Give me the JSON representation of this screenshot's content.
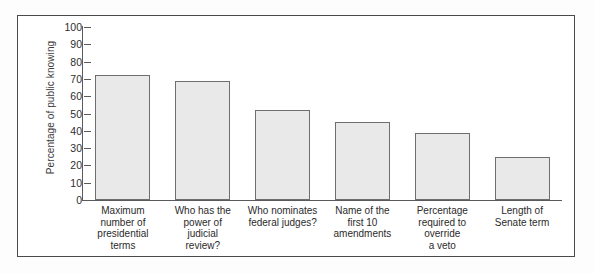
{
  "chart_data": {
    "type": "bar",
    "title": "",
    "xlabel": "",
    "ylabel": "Percentage of public knowing",
    "ylim": [
      0,
      100
    ],
    "ytick_labels": [
      "100",
      "90",
      "80",
      "70",
      "60",
      "50",
      "40",
      "30",
      "20",
      "10",
      "0"
    ],
    "ytick_values": [
      100,
      90,
      80,
      70,
      60,
      50,
      40,
      30,
      20,
      10,
      0
    ],
    "grid": false,
    "legend": null,
    "categories": [
      "Maximum number of presidential terms",
      "Who has the power of judicial review?",
      "Who nominates federal judges?",
      "Name of the first 10 amendments",
      "Percentage required to override a veto",
      "Length of Senate term"
    ],
    "category_lines": [
      [
        "Maximum",
        "number of",
        "presidential",
        "terms"
      ],
      [
        "Who has the",
        "power of",
        "judicial",
        "review?"
      ],
      [
        "Who nominates",
        "federal judges?"
      ],
      [
        "Name of the",
        "first 10",
        "amendments"
      ],
      [
        "Percentage",
        "required to",
        "override",
        "a veto"
      ],
      [
        "Length of",
        "Senate term"
      ]
    ],
    "values": [
      72,
      69,
      52,
      45,
      39,
      25
    ],
    "bar_fill_color": "#e9e9e9",
    "bar_edge_color": "#6e6e6e",
    "frame_color": "#4a4a4a",
    "axis_color": "#5a5a5a"
  }
}
